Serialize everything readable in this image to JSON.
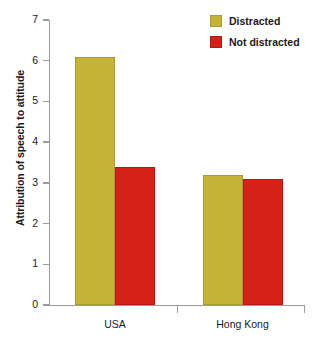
{
  "chart_data": {
    "type": "bar",
    "title": "",
    "subtitle": "",
    "xlabel": "",
    "ylabel": "Attribution of speech to attitude",
    "categories": [
      "USA",
      "Hong Kong"
    ],
    "series": [
      {
        "name": "Distracted",
        "values": [
          6.1,
          3.2
        ],
        "color": "#c5b337"
      },
      {
        "name": "Not distracted",
        "values": [
          3.4,
          3.1
        ],
        "color": "#d42218"
      }
    ],
    "ylim": [
      0,
      7
    ],
    "ytick_labels": [
      "0",
      "1",
      "2",
      "3",
      "4",
      "5",
      "6",
      "7"
    ],
    "ytick_values": [
      0,
      1,
      2,
      3,
      4,
      5,
      6,
      7
    ],
    "grid": false,
    "legend_position": "top-right",
    "background_color": "#ffffff",
    "axis_color": "#9b9b9b"
  },
  "legend": {
    "items": [
      {
        "label": "Distracted"
      },
      {
        "label": "Not distracted"
      }
    ]
  }
}
